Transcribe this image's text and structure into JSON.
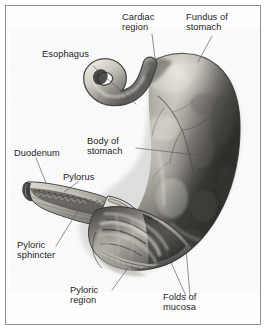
{
  "figure": {
    "type": "anatomical-illustration",
    "subject": "Stomach",
    "view": "anterior, partially sectioned",
    "width": 268,
    "height": 335,
    "background_color": "#ffffff",
    "frame_color": "#8d8f93",
    "label_color": "#1d1d1f",
    "leader_color": "#55585c"
  },
  "labels": {
    "cardiac_region": "Cardiac\nregion",
    "fundus_of_stomach": "Fundus of\nstomach",
    "esophagus": "Esophagus",
    "body_of_stomach": "Body of\nstomach",
    "duodenum": "Duodenum",
    "pylorus": "Pylorus",
    "pyloric_sphincter": "Pyloric\nsphincter",
    "pyloric_region": "Pyloric\nregion",
    "folds_of_mucosa": "Folds of\nmucosa"
  },
  "structures": [
    {
      "id": "cardiac-region",
      "name": "Cardiac region"
    },
    {
      "id": "fundus-of-stomach",
      "name": "Fundus of stomach"
    },
    {
      "id": "esophagus",
      "name": "Esophagus"
    },
    {
      "id": "body-of-stomach",
      "name": "Body of stomach"
    },
    {
      "id": "duodenum",
      "name": "Duodenum"
    },
    {
      "id": "pylorus",
      "name": "Pylorus"
    },
    {
      "id": "pyloric-sphincter",
      "name": "Pyloric sphincter"
    },
    {
      "id": "pyloric-region",
      "name": "Pyloric region"
    },
    {
      "id": "folds-of-mucosa",
      "name": "Folds of mucosa"
    }
  ]
}
